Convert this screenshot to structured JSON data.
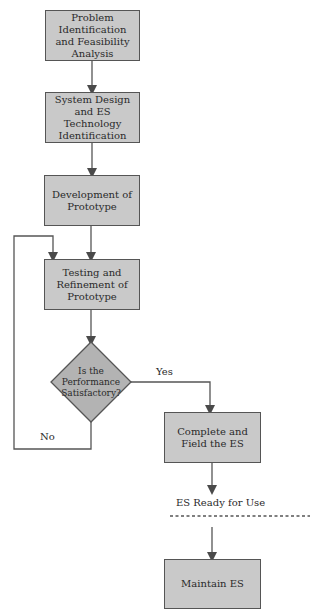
{
  "diagram": {
    "type": "flowchart",
    "nodes": [
      {
        "id": "problem",
        "shape": "rect",
        "label": "Problem Identification and Feasibility Analysis"
      },
      {
        "id": "design",
        "shape": "rect",
        "label": "System Design and ES Technology Identification"
      },
      {
        "id": "prototype",
        "shape": "rect",
        "label": "Development of Prototype"
      },
      {
        "id": "testing",
        "shape": "rect",
        "label": "Testing and Refinement of Prototype"
      },
      {
        "id": "decision",
        "shape": "diamond",
        "label": "Is the Performance Satisfactory?"
      },
      {
        "id": "complete",
        "shape": "rect",
        "label": "Complete and Field the ES"
      },
      {
        "id": "maintain",
        "shape": "rect",
        "label": "Maintain ES"
      }
    ],
    "edges": [
      {
        "from": "problem",
        "to": "design",
        "label": ""
      },
      {
        "from": "design",
        "to": "prototype",
        "label": ""
      },
      {
        "from": "prototype",
        "to": "testing",
        "label": ""
      },
      {
        "from": "testing",
        "to": "decision",
        "label": ""
      },
      {
        "from": "decision",
        "to": "complete",
        "label": "Yes"
      },
      {
        "from": "decision",
        "to": "testing",
        "label": "No"
      },
      {
        "from": "complete",
        "to": "maintain",
        "label": ""
      }
    ],
    "milestone": {
      "label": "ES Ready for Use",
      "style": "dashed-line"
    },
    "labels": {
      "yes": "Yes",
      "no": "No",
      "ready": "ES Ready for Use"
    },
    "colors": {
      "box_fill": "#c9c9c9",
      "diamond_fill": "#b3b3b3",
      "stroke": "#555555",
      "background": "#ffffff"
    }
  }
}
